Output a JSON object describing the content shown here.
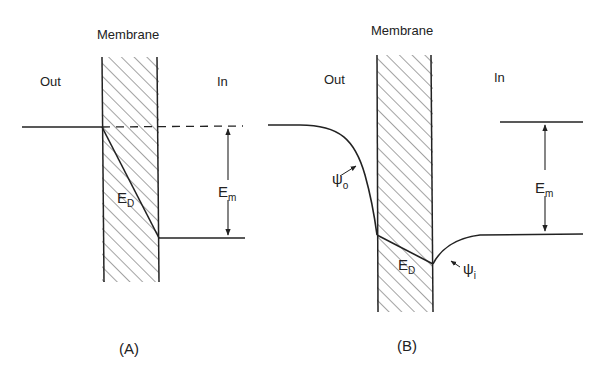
{
  "panels": [
    {
      "id": "A",
      "caption": "(A)",
      "membrane_label": "Membrane",
      "out_label": "Out",
      "in_label": "In",
      "em_label": "E",
      "em_sub": "m",
      "ed_label": "E",
      "ed_sub": "D"
    },
    {
      "id": "B",
      "caption": "(B)",
      "membrane_label": "Membrane",
      "out_label": "Out",
      "in_label": "In",
      "em_label": "E",
      "em_sub": "m",
      "ed_label": "E",
      "ed_sub": "D",
      "psi_o_label": "ψ",
      "psi_o_sub": "o",
      "psi_i_label": "ψ",
      "psi_i_sub": "i"
    }
  ],
  "colors": {
    "ink": "#222222",
    "background": "#ffffff"
  }
}
